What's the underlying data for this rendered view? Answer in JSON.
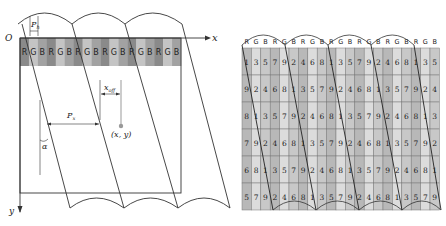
{
  "left_diagram": {
    "labels": {
      "origin": "O",
      "x_axis": "x",
      "y_axis": "y",
      "ph": "P",
      "ph_sub": "h",
      "px": "P",
      "px_sub": "x",
      "xoff": "x",
      "xoff_sub": "off",
      "point": "(x, y)",
      "alpha": "α"
    },
    "strip": [
      "R",
      "G",
      "B",
      "R",
      "G",
      "B",
      "R",
      "G",
      "B",
      "R",
      "G",
      "B",
      "R",
      "G",
      "B",
      "R",
      "G",
      "B"
    ],
    "strip_colors": {
      "R": "#8a8a8a",
      "G": "#c4c4c4",
      "B": "#a2a2a2"
    }
  },
  "right_diagram": {
    "header": [
      "R",
      "G",
      "B",
      "R",
      "G",
      "B",
      "R",
      "G",
      "B",
      "R",
      "G",
      "B",
      "R",
      "G",
      "B",
      "R",
      "G",
      "B",
      "R",
      "G",
      "B"
    ],
    "rows": [
      [
        1,
        3,
        5,
        7,
        9,
        2,
        4,
        6,
        8,
        1,
        3,
        5,
        7,
        9,
        2,
        4,
        6,
        8,
        1,
        3,
        5
      ],
      [
        9,
        2,
        4,
        6,
        8,
        1,
        3,
        5,
        7,
        9,
        2,
        4,
        6,
        8,
        1,
        3,
        5,
        7,
        9,
        2,
        4
      ],
      [
        8,
        1,
        3,
        5,
        7,
        9,
        2,
        4,
        6,
        8,
        1,
        3,
        5,
        7,
        9,
        2,
        4,
        6,
        8,
        1,
        3
      ],
      [
        7,
        9,
        2,
        4,
        6,
        8,
        1,
        3,
        5,
        7,
        9,
        2,
        4,
        6,
        8,
        1,
        3,
        5,
        7,
        9,
        2
      ],
      [
        6,
        8,
        1,
        3,
        5,
        7,
        9,
        2,
        4,
        6,
        8,
        1,
        3,
        5,
        7,
        9,
        2,
        4,
        6,
        8,
        1
      ],
      [
        5,
        7,
        9,
        2,
        4,
        6,
        8,
        1,
        3,
        5,
        7,
        9,
        2,
        4,
        6,
        8,
        1,
        3,
        5,
        7,
        9
      ]
    ],
    "cell_colors": {
      "R": "#b8b8b8",
      "G": "#dcdcdc",
      "B": "#c8c8c8"
    }
  }
}
